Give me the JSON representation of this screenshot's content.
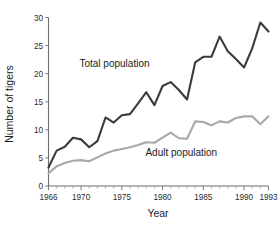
{
  "chart_data": {
    "type": "line",
    "title": "",
    "xlabel": "Year",
    "ylabel": "Number of tigers",
    "xlim": [
      1966,
      1993
    ],
    "ylim": [
      0,
      30
    ],
    "yticks": [
      0,
      5,
      10,
      15,
      20,
      25,
      30
    ],
    "ytick_labels": [
      "0",
      "5",
      "10",
      "15",
      "20",
      "25",
      "30"
    ],
    "xticks_major": [
      1966,
      1970,
      1975,
      1980,
      1985,
      1990,
      1993
    ],
    "xtick_labels": [
      "1966",
      "1970",
      "1975",
      "1980",
      "1985",
      "1990",
      "1993"
    ],
    "xticks_minor_step": 1,
    "grid": false,
    "legend": "inline-annotations",
    "x": [
      1966,
      1967,
      1968,
      1969,
      1970,
      1971,
      1972,
      1973,
      1974,
      1975,
      1976,
      1977,
      1978,
      1979,
      1980,
      1981,
      1982,
      1983,
      1984,
      1985,
      1986,
      1987,
      1988,
      1989,
      1990,
      1991,
      1992,
      1993
    ],
    "series": [
      {
        "name": "Total population",
        "color": "#3b3b3b",
        "width": 2.1,
        "label_x": 1974.1,
        "label_y": 21.2,
        "values": [
          3.3,
          6.3,
          7.0,
          8.6,
          8.3,
          6.9,
          8.0,
          12.2,
          11.3,
          12.6,
          12.8,
          14.7,
          16.7,
          14.4,
          17.8,
          18.5,
          17.1,
          15.4,
          22.0,
          23.0,
          23.0,
          26.6,
          24.0,
          22.6,
          21.1,
          24.5,
          29.1,
          27.5
        ]
      },
      {
        "name": "Adult population",
        "color": "#a8a8a8",
        "width": 2.1,
        "label_x": 1982.3,
        "label_y": 5.3,
        "values": [
          2.3,
          3.5,
          4.1,
          4.5,
          4.6,
          4.4,
          5.1,
          5.8,
          6.3,
          6.6,
          6.9,
          7.3,
          7.8,
          7.7,
          8.6,
          9.5,
          8.5,
          8.4,
          11.5,
          11.4,
          10.8,
          11.5,
          11.3,
          12.1,
          12.4,
          12.4,
          11.0,
          12.4
        ]
      }
    ]
  },
  "labels": {
    "y_axis_title": "Number of tigers",
    "x_axis_title": "Year",
    "total_population": "Total population",
    "adult_population": "Adult population"
  }
}
